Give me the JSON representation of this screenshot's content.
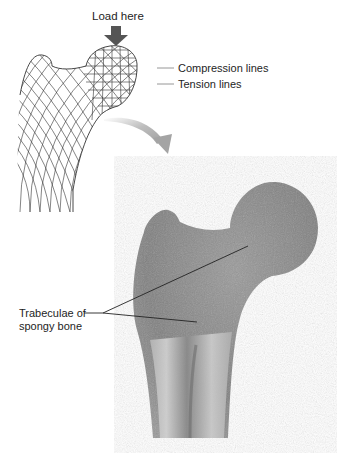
{
  "diagram": {
    "load_label": "Load here",
    "legend": [
      {
        "label": "Compression lines",
        "line_color": "#8a8a8a"
      },
      {
        "label": "Tension lines",
        "line_color": "#8a8a8a"
      }
    ],
    "callout": {
      "line1": "Trabeculae of",
      "line2": "spongy bone"
    },
    "colors": {
      "load_arrow": "#555555",
      "transition_arrow": "#a8a8a8",
      "bone_fill": "#8e8e8e",
      "bone_cortex": "#c9c9c9",
      "mesh_stroke": "#333333",
      "leader_line": "#222222"
    }
  }
}
